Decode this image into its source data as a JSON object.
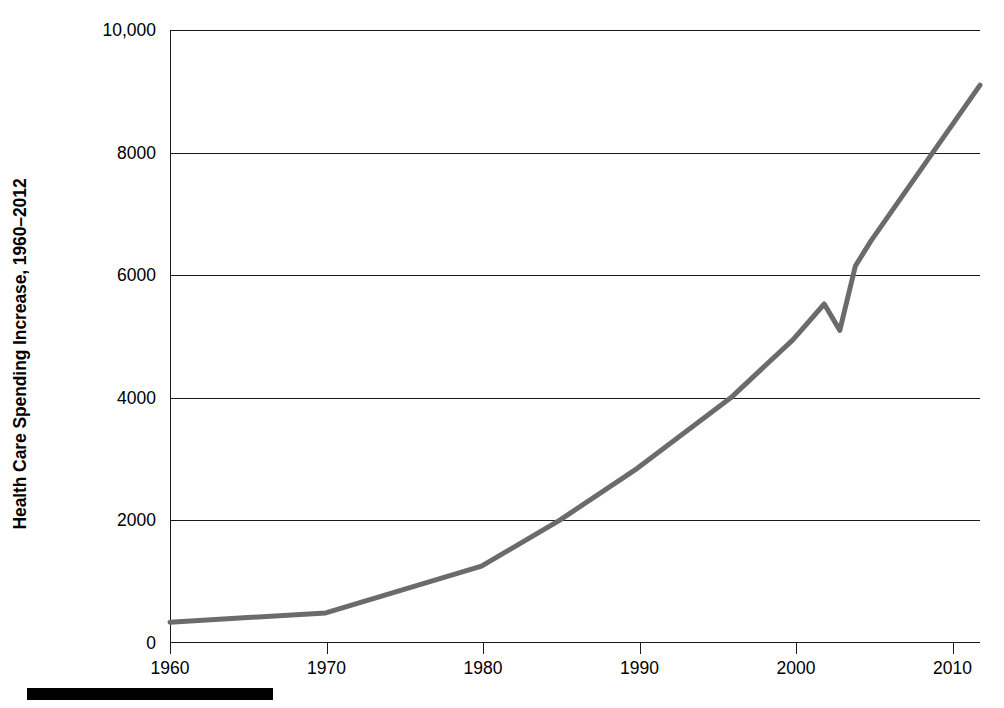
{
  "axis": {
    "y_title": "Health Care Spending Increase, 1960–2012",
    "y_ticks": [
      "10,000",
      "8000",
      "6000",
      "4000",
      "2000",
      "0"
    ],
    "x_ticks": [
      "1960",
      "1970",
      "1980",
      "1990",
      "2000",
      "2010"
    ]
  },
  "style": {
    "line_color": "#6b6b6b",
    "axis_color": "#1a1a1a",
    "background": "#ffffff",
    "footer_bar_color": "#000000"
  },
  "chart_data": {
    "type": "line",
    "title": "",
    "xlabel": "",
    "ylabel": "Health Care Spending Increase, 1960–2012",
    "xlim": [
      1960,
      2012
    ],
    "ylim": [
      0,
      10000
    ],
    "xticks": [
      1960,
      1970,
      1980,
      1990,
      2000,
      2010
    ],
    "yticks": [
      0,
      2000,
      4000,
      6000,
      8000,
      10000
    ],
    "grid": "horizontal",
    "legend": "none",
    "series": [
      {
        "name": "Health care spending per capita",
        "x": [
          1960,
          1970,
          1980,
          1985,
          1990,
          1996,
          2000,
          2002,
          2003,
          2004,
          2005,
          2012
        ],
        "values": [
          340,
          490,
          1255,
          2000,
          2850,
          4000,
          4950,
          5530,
          5100,
          6150,
          6560,
          9100
        ]
      }
    ]
  }
}
